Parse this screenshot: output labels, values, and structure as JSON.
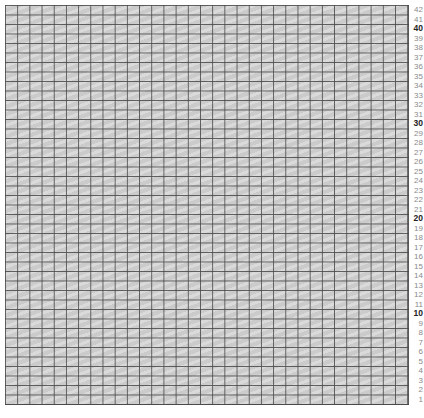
{
  "grid": {
    "columns": 33,
    "rows": 42,
    "fill_color": "#d2d2d2",
    "line_color": "#464646"
  },
  "row_labels": [
    {
      "label": "42",
      "major": false
    },
    {
      "label": "41",
      "major": false
    },
    {
      "label": "40",
      "major": true
    },
    {
      "label": "39",
      "major": false
    },
    {
      "label": "38",
      "major": false
    },
    {
      "label": "37",
      "major": false
    },
    {
      "label": "36",
      "major": false
    },
    {
      "label": "35",
      "major": false
    },
    {
      "label": "34",
      "major": false
    },
    {
      "label": "33",
      "major": false
    },
    {
      "label": "32",
      "major": false
    },
    {
      "label": "31",
      "major": false
    },
    {
      "label": "30",
      "major": true
    },
    {
      "label": "29",
      "major": false
    },
    {
      "label": "28",
      "major": false
    },
    {
      "label": "27",
      "major": false
    },
    {
      "label": "26",
      "major": false
    },
    {
      "label": "25",
      "major": false
    },
    {
      "label": "24",
      "major": false
    },
    {
      "label": "23",
      "major": false
    },
    {
      "label": "22",
      "major": false
    },
    {
      "label": "21",
      "major": false
    },
    {
      "label": "20",
      "major": true
    },
    {
      "label": "19",
      "major": false
    },
    {
      "label": "18",
      "major": false
    },
    {
      "label": "17",
      "major": false
    },
    {
      "label": "16",
      "major": false
    },
    {
      "label": "15",
      "major": false
    },
    {
      "label": "14",
      "major": false
    },
    {
      "label": "13",
      "major": false
    },
    {
      "label": "12",
      "major": false
    },
    {
      "label": "11",
      "major": false
    },
    {
      "label": "10",
      "major": true
    },
    {
      "label": "9",
      "major": false
    },
    {
      "label": "8",
      "major": false
    },
    {
      "label": "7",
      "major": false
    },
    {
      "label": "6",
      "major": false
    },
    {
      "label": "5",
      "major": false
    },
    {
      "label": "4",
      "major": false
    },
    {
      "label": "3",
      "major": false
    },
    {
      "label": "2",
      "major": false
    },
    {
      "label": "1",
      "major": false
    }
  ]
}
